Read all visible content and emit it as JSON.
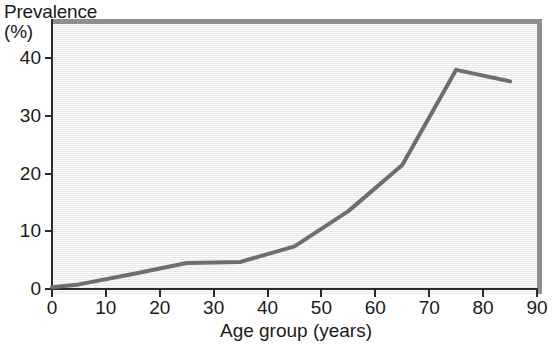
{
  "chart_data": {
    "type": "line",
    "title": "",
    "xlabel": "Age group (years)",
    "ylabel": "Prevalence (%)",
    "ylabel_line1": "Prevalence",
    "ylabel_line2": "(%)",
    "xlim": [
      0,
      90
    ],
    "ylim": [
      0,
      43
    ],
    "xticks": [
      0,
      10,
      20,
      30,
      40,
      50,
      60,
      70,
      80,
      90
    ],
    "yticks": [
      0,
      10,
      20,
      30,
      40
    ],
    "xtick_labels": [
      "0",
      "10",
      "20",
      "30",
      "40",
      "50",
      "60",
      "70",
      "80",
      "90"
    ],
    "ytick_labels": [
      "0",
      "10",
      "20",
      "30",
      "40"
    ],
    "grid": false,
    "legend": null,
    "series": [
      {
        "name": "Prevalence",
        "color": "#6e6e6e",
        "line_width": 4,
        "x": [
          0,
          5,
          15,
          25,
          35,
          45,
          55,
          65,
          75,
          85
        ],
        "y": [
          0.3,
          0.8,
          2.6,
          4.5,
          4.7,
          7.4,
          13.5,
          21.5,
          38.0,
          36.0
        ]
      }
    ],
    "colors": {
      "line": "#6e6e6e",
      "plot_background": "#eeeeee",
      "plot_border": "#8f8f8f",
      "axis": "#2b2b2b",
      "text": "#1a1a1a",
      "page_background": "#ffffff"
    }
  }
}
